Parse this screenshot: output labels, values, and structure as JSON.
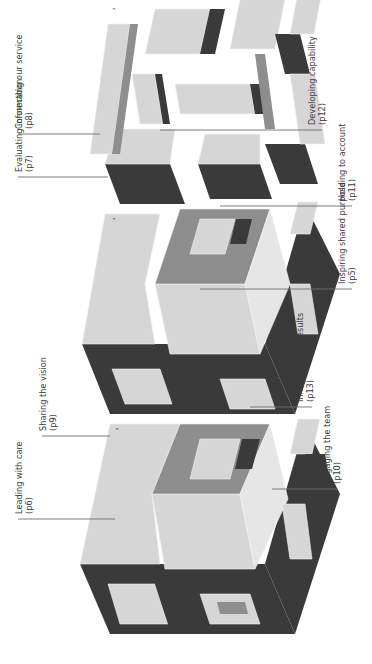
{
  "diagram": {
    "orientation": "rotated 90 degrees counter-clockwise",
    "colors": {
      "dark_face": "#3a3a3a",
      "mid_face": "#8e8e8e",
      "light_face": "#d6d6d6",
      "leader_line": "#6d6d6d",
      "label_text": "#3c3c3c"
    },
    "cubes": [
      {
        "name": "Cube 1",
        "labels": [
          {
            "title": "Leading with care",
            "page": "(p6)"
          },
          {
            "title": "Sharing the vision",
            "page": "(p9)"
          },
          {
            "title": "Influencing for results",
            "page": "(p13)"
          },
          {
            "title": "Engaging the team",
            "page": "(p10)"
          }
        ]
      },
      {
        "name": "Cube 2",
        "labels": [
          {
            "title": "Evaluating information",
            "page": "(p7)"
          },
          {
            "title": "Inspiring shared purpose",
            "page": "(p5)"
          }
        ]
      },
      {
        "name": "Cube 3",
        "labels": [
          {
            "title": "Connecting our service",
            "page": "(p8)"
          },
          {
            "title": "Developing capability",
            "page": "(p12)"
          },
          {
            "title": "Holding to account",
            "page": "(p11)"
          }
        ]
      }
    ]
  }
}
